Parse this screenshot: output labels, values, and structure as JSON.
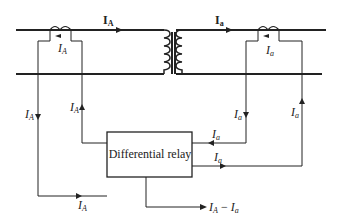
{
  "diagram": {
    "relay": {
      "label": "Differential relay"
    },
    "primary_current": {
      "main": "I",
      "sub": "A"
    },
    "secondary_current": {
      "main": "I",
      "sub": "a"
    },
    "output": {
      "label": "I",
      "sub": "A",
      "minus": " − ",
      "label2": "I",
      "sub2": "a"
    },
    "labels": {
      "left_ct": {
        "main": "I",
        "sub": "A"
      },
      "left_down": {
        "main": "I",
        "sub": "A"
      },
      "left_up": {
        "main": "I",
        "sub": "A"
      },
      "left_bottom": {
        "main": "I",
        "sub": "A"
      },
      "right_ct": {
        "main": "I",
        "sub": "a"
      },
      "right_down": {
        "main": "I",
        "sub": "a"
      },
      "right_up": {
        "main": "I",
        "sub": "a"
      },
      "right_in": {
        "main": "I",
        "sub": "a"
      },
      "right_out": {
        "main": "I",
        "sub": "a"
      }
    },
    "colors": {
      "line": "#222222",
      "background": "#ffffff"
    }
  }
}
